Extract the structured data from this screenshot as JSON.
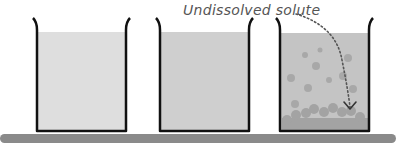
{
  "annotation": {
    "label": "Undissolved solute"
  },
  "colors": {
    "background": "#ffffff",
    "beaker_outline": "#111111",
    "liquid_light": "#dedede",
    "liquid_medium": "#cfcfcf",
    "liquid_third": "#c4c4c4",
    "particle": "#a8a8a8",
    "sediment": "#a3a3a3",
    "bench": "#8a8a8a",
    "arrow": "#555555",
    "label_text": "#555555"
  },
  "beakers": [
    {
      "name": "unsaturated",
      "state": "clear solution"
    },
    {
      "name": "saturated",
      "state": "clear solution, slightly darker"
    },
    {
      "name": "supersaturated-with-excess",
      "state": "solution with suspended particles and undissolved solute at bottom"
    }
  ]
}
